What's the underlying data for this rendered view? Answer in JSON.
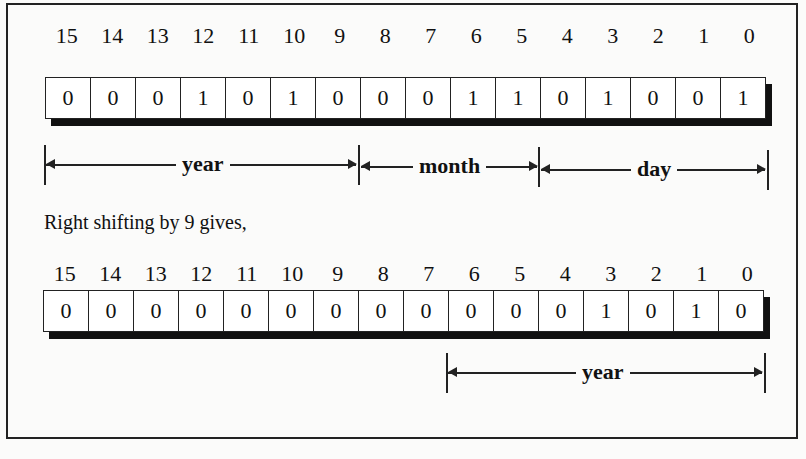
{
  "figure": {
    "register1": {
      "bit_positions": [
        "15",
        "14",
        "13",
        "12",
        "11",
        "10",
        "9",
        "8",
        "7",
        "6",
        "5",
        "4",
        "3",
        "2",
        "1",
        "0"
      ],
      "bits": [
        "0",
        "0",
        "0",
        "1",
        "0",
        "1",
        "0",
        "0",
        "0",
        "1",
        "1",
        "0",
        "1",
        "0",
        "0",
        "1"
      ],
      "fields": [
        {
          "label": "year",
          "from_bit": 15,
          "to_bit": 9
        },
        {
          "label": "month",
          "from_bit": 8,
          "to_bit": 5
        },
        {
          "label": "day",
          "from_bit": 4,
          "to_bit": 0
        }
      ]
    },
    "caption": "Right shifting by 9 gives,",
    "register2": {
      "bit_positions": [
        "15",
        "14",
        "13",
        "12",
        "11",
        "10",
        "9",
        "8",
        "7",
        "6",
        "5",
        "4",
        "3",
        "2",
        "1",
        "0"
      ],
      "bits": [
        "0",
        "0",
        "0",
        "0",
        "0",
        "0",
        "0",
        "0",
        "0",
        "0",
        "0",
        "0",
        "1",
        "0",
        "1",
        "0"
      ],
      "fields": [
        {
          "label": "year",
          "from_bit": 6,
          "to_bit": 0
        }
      ]
    }
  }
}
